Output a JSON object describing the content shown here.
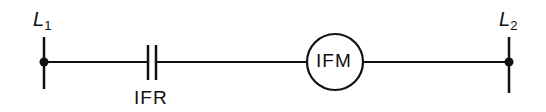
{
  "diagram": {
    "type": "ladder-logic-rung",
    "rails": {
      "left": {
        "label": "L",
        "subscript": "1"
      },
      "right": {
        "label": "L",
        "subscript": "2"
      }
    },
    "contact": {
      "label": "IFR",
      "type": "normally-open"
    },
    "coil": {
      "label": "IFM"
    },
    "colors": {
      "line": "#111111",
      "background": "#ffffff"
    }
  }
}
